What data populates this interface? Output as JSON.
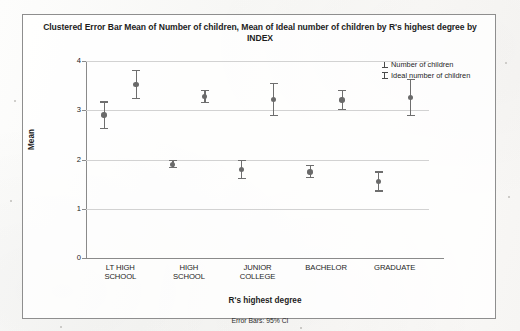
{
  "card": {
    "title": "Clustered Error Bar Mean of Number of children, Mean of Ideal number of children by R's highest degree by INDEX",
    "footnote": "Error Bars: 95% CI"
  },
  "legend": {
    "items": [
      {
        "label": "Number of children",
        "glyph": "error-bar-icon"
      },
      {
        "label": "Ideal number of children",
        "glyph": "error-bar-icon"
      }
    ]
  },
  "axes": {
    "y_title": "Mean",
    "x_title": "R's highest degree",
    "y_ticks": [
      "0",
      "1",
      "2",
      "3",
      "4"
    ]
  },
  "chart_data": {
    "type": "scatter",
    "title": "Clustered Error Bar Mean of Number of children, Mean of Ideal number of children by R's highest degree by INDEX",
    "xlabel": "R's highest degree",
    "ylabel": "Mean",
    "ylim": [
      0,
      4
    ],
    "yticks": [
      0,
      1,
      2,
      3,
      4
    ],
    "grid": "horizontal",
    "legend_position": "top-right",
    "error_bars": "95% CI",
    "categories": [
      "LT HIGH SCHOOL",
      "HIGH SCHOOL",
      "JUNIOR COLLEGE",
      "BACHELOR",
      "GRADUATE"
    ],
    "series": [
      {
        "name": "Number of children",
        "values": [
          2.9,
          1.9,
          1.8,
          1.75,
          1.55
        ],
        "ci_low": [
          2.62,
          1.82,
          1.61,
          1.62,
          1.35
        ],
        "ci_high": [
          3.18,
          2.0,
          2.0,
          1.89,
          1.76
        ]
      },
      {
        "name": "Ideal number of children",
        "values": [
          3.52,
          3.28,
          3.22,
          3.21,
          3.26
        ],
        "ci_low": [
          3.22,
          3.14,
          2.88,
          3.0,
          2.88
        ],
        "ci_high": [
          3.82,
          3.42,
          3.56,
          3.42,
          3.64
        ]
      }
    ]
  }
}
